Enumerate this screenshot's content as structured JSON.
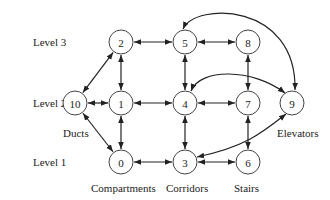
{
  "levels": [
    {
      "id": "level3",
      "label": "Level 3"
    },
    {
      "id": "level2",
      "label": "Level 2"
    },
    {
      "id": "level1",
      "label": "Level 1"
    }
  ],
  "nodes": [
    {
      "id": "0",
      "label": "0",
      "level": 1,
      "col": 1
    },
    {
      "id": "1",
      "label": "1",
      "level": 2,
      "col": 1
    },
    {
      "id": "2",
      "label": "2",
      "level": 3,
      "col": 1
    },
    {
      "id": "3",
      "label": "3",
      "level": 1,
      "col": 2
    },
    {
      "id": "4",
      "label": "4",
      "level": 2,
      "col": 2
    },
    {
      "id": "5",
      "label": "5",
      "level": 3,
      "col": 2
    },
    {
      "id": "6",
      "label": "6",
      "level": 1,
      "col": 3
    },
    {
      "id": "7",
      "label": "7",
      "level": 2,
      "col": 3
    },
    {
      "id": "8",
      "label": "8",
      "level": 3,
      "col": 3
    },
    {
      "id": "9",
      "label": "9",
      "level": 2,
      "col": 4
    },
    {
      "id": "10",
      "label": "10",
      "level": 2,
      "col": 0
    }
  ],
  "edges": [
    {
      "from": "2",
      "to": "5",
      "type": "straight",
      "bidirectional": true
    },
    {
      "from": "5",
      "to": "8",
      "type": "straight",
      "bidirectional": true
    },
    {
      "from": "2",
      "to": "10",
      "type": "straight",
      "bidirectional": true
    },
    {
      "from": "2",
      "to": "1",
      "type": "straight",
      "bidirectional": true
    },
    {
      "from": "5",
      "to": "4",
      "type": "straight",
      "bidirectional": true
    },
    {
      "from": "8",
      "to": "7",
      "type": "straight",
      "bidirectional": true
    },
    {
      "from": "10",
      "to": "1",
      "type": "straight",
      "bidirectional": true
    },
    {
      "from": "1",
      "to": "4",
      "type": "straight",
      "bidirectional": true
    },
    {
      "from": "4",
      "to": "7",
      "type": "straight",
      "bidirectional": true
    },
    {
      "from": "10",
      "to": "0",
      "type": "straight",
      "bidirectional": true
    },
    {
      "from": "1",
      "to": "0",
      "type": "straight",
      "bidirectional": true
    },
    {
      "from": "4",
      "to": "3",
      "type": "straight",
      "bidirectional": true
    },
    {
      "from": "7",
      "to": "6",
      "type": "straight",
      "bidirectional": true
    },
    {
      "from": "0",
      "to": "3",
      "type": "straight",
      "bidirectional": true
    },
    {
      "from": "3",
      "to": "6",
      "type": "straight",
      "bidirectional": true
    },
    {
      "from": "5",
      "to": "9",
      "type": "curve-top",
      "bidirectional": true
    },
    {
      "from": "4",
      "to": "9",
      "type": "curve-mid",
      "bidirectional": true
    },
    {
      "from": "3",
      "to": "9",
      "type": "curve-low",
      "bidirectional": true
    }
  ],
  "annotations": [
    {
      "id": "ducts",
      "text": "Ducts",
      "node": "10"
    },
    {
      "id": "elevators",
      "text": "Elevators",
      "node": "9"
    },
    {
      "id": "compartments",
      "text": "Compartments",
      "node": "0"
    },
    {
      "id": "corridors",
      "text": "Corridors",
      "node": "3"
    },
    {
      "id": "stairs",
      "text": "Stairs",
      "node": "6"
    }
  ]
}
